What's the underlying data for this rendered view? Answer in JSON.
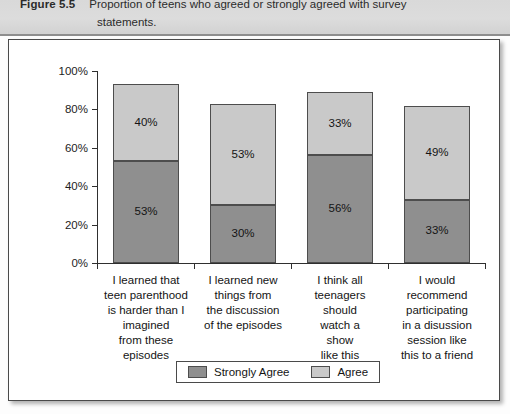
{
  "caption": {
    "figure_label": "Figure 5.5",
    "line1": "Proportion of teens who agreed or strongly agreed with survey",
    "line2": "statements."
  },
  "colors": {
    "strongly_agree": "#8f8f8f",
    "agree": "#c9c9c9",
    "axis": "#2f2f2f",
    "panel_border": "#4a4a4a",
    "caption_band": "#d9d9d9"
  },
  "legend": {
    "entries": [
      {
        "label": "Strongly Agree",
        "color": "#8f8f8f"
      },
      {
        "label": "Agree",
        "color": "#c9c9c9"
      }
    ]
  },
  "axis": {
    "y_ticks": [
      "0%",
      "20%",
      "40%",
      "60%",
      "80%",
      "100%"
    ],
    "y_min": 0,
    "y_max": 100
  },
  "chart_data": {
    "type": "bar",
    "title": "Proportion of teens who agreed or strongly agreed with survey statements.",
    "stacked": true,
    "xlabel": "",
    "ylabel": "",
    "ylim": [
      0,
      100
    ],
    "ytick_labels": [
      "0%",
      "20%",
      "40%",
      "60%",
      "80%",
      "100%"
    ],
    "grid": false,
    "legend_position": "bottom",
    "categories": [
      "I learned that teen parenthood is harder than I imagined from these episodes",
      "I learned new things from the discussion of the episodes",
      "I think all teenagers should watch a show like this",
      "I would recommend participating in a disussion session like this to a friend"
    ],
    "series": [
      {
        "name": "Strongly Agree",
        "color": "#8f8f8f",
        "values": [
          53,
          30,
          56,
          33
        ],
        "data_labels": [
          "53%",
          "30%",
          "56%",
          "33%"
        ]
      },
      {
        "name": "Agree",
        "color": "#c9c9c9",
        "values": [
          40,
          53,
          33,
          49
        ],
        "data_labels": [
          "40%",
          "53%",
          "33%",
          "49%"
        ]
      }
    ],
    "totals": [
      93,
      83,
      89,
      82
    ]
  },
  "categories_wrapped": [
    [
      "I learned that",
      "teen parenthood",
      "is harder than I",
      "imagined",
      "from these",
      "episodes"
    ],
    [
      "I learned new",
      "things from",
      "the discussion",
      "of the episodes"
    ],
    [
      "I think all",
      "teenagers",
      "should",
      "watch a",
      "show",
      "like this"
    ],
    [
      "I would",
      "recommend",
      "participating",
      "in a disussion",
      "session like",
      "this to a friend"
    ]
  ]
}
